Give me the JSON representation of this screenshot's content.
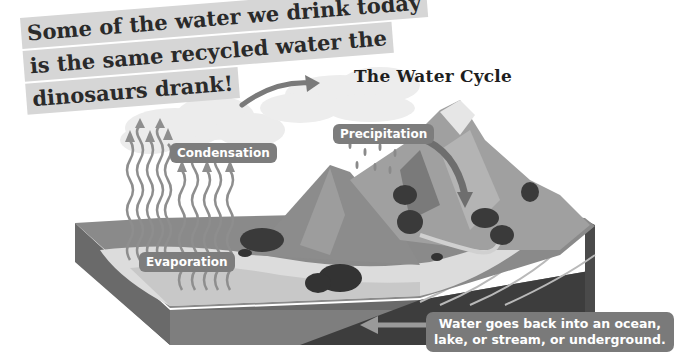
{
  "headline": {
    "lines": [
      "Some of the water we drink today",
      "is the same recycled water the",
      "dinosaurs drank!"
    ]
  },
  "title": "The Water Cycle",
  "labels": {
    "precipitation": "Precipitation",
    "condensation": "Condensation",
    "evaporation": "Evaporation",
    "return_line1": "Water goes back into an ocean,",
    "return_line2": "lake, or stream, or underground."
  },
  "colors": {
    "background": "#ffffff",
    "label_bg": "#7d7d7d",
    "headline_bg": "#d6d6d6",
    "ground_dark": "#4a4a4a",
    "ground_mid": "#8a8a8a",
    "water_light": "#d9d9d9",
    "mountain": "#9a9a9a",
    "cloud": "#ececec"
  }
}
